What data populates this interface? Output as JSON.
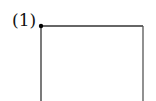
{
  "figure": {
    "label": "(1)",
    "stroke_color": "#333333",
    "dot_color": "#000000",
    "shape": "open-bottom rectangle with vertex dot at top-left"
  }
}
